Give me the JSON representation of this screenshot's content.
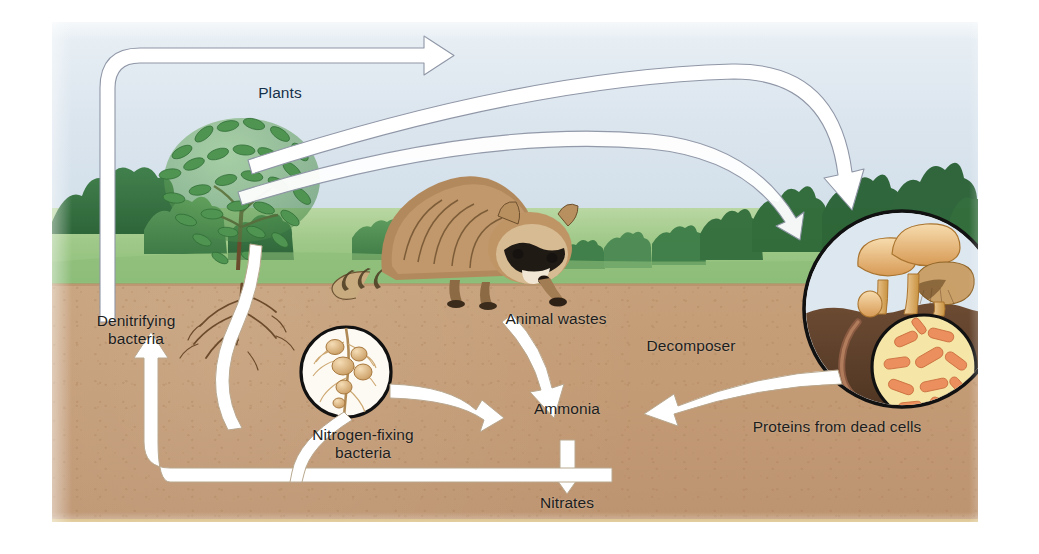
{
  "diagram": {
    "type": "ecological-cycle-illustration"
  },
  "labels": {
    "plants": "Plants",
    "animal_wastes": "Animal wastes",
    "denitrifying_bacteria": "Denitrifying\nbacteria",
    "nitrogen_fixing_bacteria": "Nitrogen-fixing\nbacteria",
    "ammonia": "Ammonia",
    "nitrates": "Nitrates",
    "decomposer": "Decomposer",
    "proteins_from_dead_cells": "Proteins from dead cells"
  },
  "scene": {
    "sky": "#dbe5ee",
    "grass": "#9ec887",
    "soil": "#c39b75",
    "soil_bottom_rule": "#d8bb72",
    "arrow_fill": "#ffffff",
    "arrow_stroke": "#8f96a6",
    "text_color": "#1d1d1b"
  },
  "illustrations": {
    "shrub": "shrub-plant",
    "raccoon": "raccoon-animal",
    "root_nodule_inset": "root-nodule-circle",
    "decomposer_inset": "mushroom-decomposer-circle",
    "bacteria_inset": "rod-bacteria-circle",
    "earthworm": "earthworm",
    "background_trees": "tree-line"
  },
  "flows": [
    {
      "from": "Denitrifying bacteria",
      "to": "Atmosphere / Plants",
      "name": "denitrification-arrow"
    },
    {
      "from": "Plants",
      "to": "Decomposer",
      "name": "plants-to-decomposer-arrow"
    },
    {
      "from": "Animal wastes",
      "to": "Ammonia",
      "name": "wastes-to-ammonia-arrow"
    },
    {
      "from": "Decomposer",
      "to": "Ammonia",
      "name": "decomposer-to-ammonia-arrow"
    },
    {
      "from": "Ammonia",
      "to": "Nitrates",
      "name": "ammonia-to-nitrates-arrow"
    },
    {
      "from": "Nitrates",
      "to": "Denitrifying bacteria",
      "name": "nitrates-to-denitrifying-arrow"
    },
    {
      "from": "Nitrogen-fixing bacteria",
      "to": "Ammonia",
      "name": "fixing-to-ammonia-arrow"
    },
    {
      "from": "Plant roots",
      "to": "Soil nitrates",
      "name": "root-uptake-arrow"
    }
  ]
}
